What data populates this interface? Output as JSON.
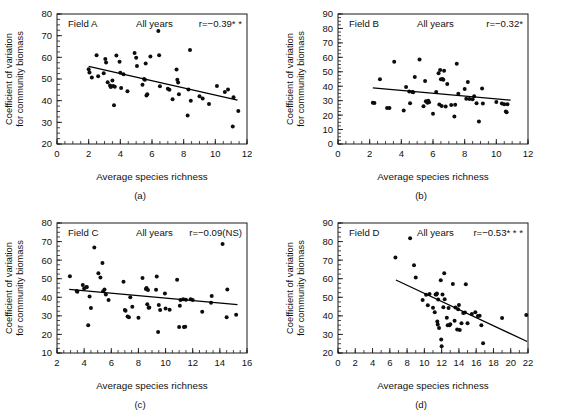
{
  "figure": {
    "title": "",
    "panel_count": 4
  },
  "common": {
    "xlabel": "Average species richness",
    "ylabel_line1": "Coefficient of variation",
    "ylabel_line2": "for community biomass",
    "years_note": "All years"
  },
  "chart_data": [
    {
      "type": "scatter",
      "panel": "(a)",
      "field_label": "Field A",
      "note": "All years",
      "r_label": "r=−0.39* *",
      "r_value": -0.39,
      "significance": "**",
      "title": "",
      "xlabel": "Average species richness",
      "ylabel": "Coefficient of variation for community biomass",
      "xlim": [
        0,
        12
      ],
      "ylim": [
        20,
        80
      ],
      "xticks": [
        0,
        2,
        4,
        6,
        8,
        10,
        12
      ],
      "yticks": [
        20,
        30,
        40,
        50,
        60,
        70,
        80
      ],
      "x_minor_step": 0.5,
      "y_minor_step": 2.5,
      "grid": false,
      "legend": "none",
      "fit_line": {
        "x0": 2.0,
        "y0": 55.8,
        "x1": 11.4,
        "y1": 40.2
      },
      "points": [
        [
          2.0,
          54.5
        ],
        [
          2.05,
          53.0
        ],
        [
          2.2,
          50.7
        ],
        [
          2.5,
          61.0
        ],
        [
          2.6,
          51.3
        ],
        [
          2.95,
          52.7
        ],
        [
          3.05,
          59.2
        ],
        [
          3.1,
          57.6
        ],
        [
          3.2,
          48.5
        ],
        [
          3.35,
          47.0
        ],
        [
          3.4,
          46.3
        ],
        [
          3.5,
          49.3
        ],
        [
          3.55,
          46.8
        ],
        [
          3.6,
          37.9
        ],
        [
          3.65,
          46.4
        ],
        [
          3.75,
          60.9
        ],
        [
          3.95,
          58.0
        ],
        [
          4.0,
          52.9
        ],
        [
          4.05,
          45.8
        ],
        [
          4.2,
          52.2
        ],
        [
          4.45,
          44.3
        ],
        [
          4.9,
          62.0
        ],
        [
          5.0,
          59.8
        ],
        [
          5.05,
          56.0
        ],
        [
          5.4,
          47.3
        ],
        [
          5.5,
          50.0
        ],
        [
          5.55,
          49.6
        ],
        [
          5.6,
          57.1
        ],
        [
          5.65,
          42.4
        ],
        [
          5.7,
          43.0
        ],
        [
          5.9,
          60.4
        ],
        [
          6.4,
          72.1
        ],
        [
          6.45,
          61.0
        ],
        [
          6.5,
          46.7
        ],
        [
          7.0,
          45.5
        ],
        [
          7.1,
          45.0
        ],
        [
          7.3,
          40.7
        ],
        [
          7.55,
          54.4
        ],
        [
          7.6,
          49.7
        ],
        [
          7.65,
          48.4
        ],
        [
          7.7,
          43.0
        ],
        [
          8.25,
          33.2
        ],
        [
          8.3,
          45.2
        ],
        [
          8.4,
          63.4
        ],
        [
          8.45,
          40.0
        ],
        [
          9.0,
          42.0
        ],
        [
          9.2,
          41.0
        ],
        [
          9.6,
          38.5
        ],
        [
          10.1,
          46.8
        ],
        [
          10.6,
          44.0
        ],
        [
          10.8,
          45.1
        ],
        [
          11.1,
          28.1
        ],
        [
          11.15,
          41.6
        ],
        [
          11.45,
          35.2
        ]
      ]
    },
    {
      "type": "scatter",
      "panel": "(b)",
      "field_label": "Field B",
      "note": "All years",
      "r_label": "r=−0.32*",
      "r_value": -0.32,
      "significance": "*",
      "title": "",
      "xlabel": "Average species richness",
      "ylabel": "Coefficient of variation for community biomass",
      "xlim": [
        0,
        12
      ],
      "ylim": [
        0,
        90
      ],
      "xticks": [
        0,
        2,
        4,
        6,
        8,
        10,
        12
      ],
      "yticks": [
        0,
        10,
        20,
        30,
        40,
        50,
        60,
        70,
        80,
        90
      ],
      "x_minor_step": 0.5,
      "y_minor_step": 2.5,
      "grid": false,
      "legend": "none",
      "fit_line": {
        "x0": 2.2,
        "y0": 38.8,
        "x1": 10.9,
        "y1": 30.4
      },
      "points": [
        [
          2.2,
          28.5
        ],
        [
          2.3,
          28.3
        ],
        [
          2.65,
          44.9
        ],
        [
          3.1,
          25.0
        ],
        [
          3.25,
          25.0
        ],
        [
          3.55,
          57.0
        ],
        [
          4.15,
          23.2
        ],
        [
          4.3,
          39.5
        ],
        [
          4.5,
          36.4
        ],
        [
          4.55,
          28.2
        ],
        [
          4.7,
          36.0
        ],
        [
          4.75,
          35.8
        ],
        [
          4.85,
          46.3
        ],
        [
          5.15,
          58.5
        ],
        [
          5.4,
          26.2
        ],
        [
          5.5,
          43.6
        ],
        [
          5.55,
          29.6
        ],
        [
          5.6,
          29.3
        ],
        [
          5.65,
          28.5
        ],
        [
          5.7,
          30.0
        ],
        [
          5.75,
          28.9
        ],
        [
          6.0,
          21.0
        ],
        [
          6.2,
          36.0
        ],
        [
          6.35,
          48.9
        ],
        [
          6.4,
          27.4
        ],
        [
          6.45,
          51.2
        ],
        [
          6.5,
          44.9
        ],
        [
          6.55,
          26.3
        ],
        [
          6.6,
          45.0
        ],
        [
          6.65,
          44.5
        ],
        [
          6.7,
          50.7
        ],
        [
          6.8,
          26.0
        ],
        [
          6.9,
          41.5
        ],
        [
          7.15,
          27.0
        ],
        [
          7.35,
          19.0
        ],
        [
          7.4,
          27.1
        ],
        [
          7.5,
          55.6
        ],
        [
          7.6,
          34.8
        ],
        [
          8.0,
          38.0
        ],
        [
          8.1,
          31.4
        ],
        [
          8.2,
          43.0
        ],
        [
          8.3,
          31.2
        ],
        [
          8.5,
          31.0
        ],
        [
          8.6,
          33.0
        ],
        [
          8.75,
          28.2
        ],
        [
          8.9,
          15.5
        ],
        [
          9.1,
          38.5
        ],
        [
          9.15,
          28.0
        ],
        [
          10.0,
          29.0
        ],
        [
          10.35,
          28.0
        ],
        [
          10.5,
          27.6
        ],
        [
          10.6,
          22.5
        ],
        [
          10.65,
          22.0
        ],
        [
          10.7,
          27.5
        ]
      ]
    },
    {
      "type": "scatter",
      "panel": "(c)",
      "field_label": "Field C",
      "note": "All years",
      "r_label": "r=−0.09(NS)",
      "r_value": -0.09,
      "significance": "NS",
      "title": "",
      "xlabel": "Average species richness",
      "ylabel": "Coefficient of variation for community biomass",
      "xlim": [
        2,
        16
      ],
      "ylim": [
        10,
        80
      ],
      "xticks": [
        2,
        4,
        6,
        8,
        10,
        12,
        14,
        16
      ],
      "yticks": [
        10,
        20,
        30,
        40,
        50,
        60,
        70,
        80
      ],
      "x_minor_step": 0.5,
      "y_minor_step": 2.5,
      "grid": false,
      "legend": "none",
      "fit_line": {
        "x0": 2.9,
        "y0": 44.3,
        "x1": 15.3,
        "y1": 36.0
      },
      "points": [
        [
          2.95,
          51.3
        ],
        [
          3.45,
          43.4
        ],
        [
          3.5,
          43.0
        ],
        [
          3.9,
          46.6
        ],
        [
          4.0,
          44.7
        ],
        [
          4.15,
          45.4
        ],
        [
          4.2,
          45.6
        ],
        [
          4.3,
          25.0
        ],
        [
          4.4,
          40.4
        ],
        [
          4.5,
          34.2
        ],
        [
          4.75,
          66.8
        ],
        [
          5.05,
          53.0
        ],
        [
          5.2,
          50.6
        ],
        [
          5.35,
          58.4
        ],
        [
          5.4,
          43.2
        ],
        [
          5.5,
          44.2
        ],
        [
          5.6,
          41.5
        ],
        [
          5.8,
          38.5
        ],
        [
          6.9,
          48.3
        ],
        [
          7.0,
          33.2
        ],
        [
          7.05,
          32.8
        ],
        [
          7.2,
          29.6
        ],
        [
          7.3,
          29.2
        ],
        [
          7.4,
          40.0
        ],
        [
          7.55,
          34.9
        ],
        [
          8.0,
          29.0
        ],
        [
          8.3,
          50.4
        ],
        [
          8.55,
          44.5
        ],
        [
          8.6,
          45.0
        ],
        [
          8.65,
          36.3
        ],
        [
          8.7,
          43.9
        ],
        [
          8.75,
          34.3
        ],
        [
          8.8,
          34.5
        ],
        [
          9.3,
          44.0
        ],
        [
          9.35,
          51.2
        ],
        [
          9.45,
          21.3
        ],
        [
          9.5,
          35.8
        ],
        [
          9.6,
          33.2
        ],
        [
          9.95,
          42.1
        ],
        [
          10.0,
          34.0
        ],
        [
          10.3,
          33.3
        ],
        [
          10.85,
          49.4
        ],
        [
          11.0,
          24.0
        ],
        [
          11.05,
          35.5
        ],
        [
          11.1,
          38.5
        ],
        [
          11.3,
          39.0
        ],
        [
          11.35,
          24.0
        ],
        [
          11.45,
          24.1
        ],
        [
          11.5,
          38.7
        ],
        [
          11.85,
          39.0
        ],
        [
          12.0,
          38.6
        ],
        [
          12.7,
          32.2
        ],
        [
          13.35,
          37.0
        ],
        [
          13.4,
          40.7
        ],
        [
          14.2,
          68.7
        ],
        [
          14.5,
          29.2
        ],
        [
          14.55,
          44.2
        ],
        [
          15.2,
          30.6
        ]
      ]
    },
    {
      "type": "scatter",
      "panel": "(d)",
      "field_label": "Field D",
      "note": "All years",
      "r_label": "r=−0.53* * *",
      "r_value": -0.53,
      "significance": "***",
      "title": "",
      "xlabel": "Average species richness",
      "ylabel": "Coefficient of variation for community biomass",
      "xlim": [
        0,
        22
      ],
      "ylim": [
        20,
        90
      ],
      "xticks": [
        0,
        2,
        4,
        6,
        8,
        10,
        12,
        14,
        16,
        18,
        20,
        22
      ],
      "yticks": [
        20,
        30,
        40,
        50,
        60,
        70,
        80,
        90
      ],
      "x_minor_step": 1,
      "y_minor_step": 2.5,
      "grid": false,
      "legend": "none",
      "fit_line": {
        "x0": 6.7,
        "y0": 59.3,
        "x1": 21.9,
        "y1": 26.2
      },
      "points": [
        [
          6.65,
          71.4
        ],
        [
          8.35,
          81.8
        ],
        [
          8.8,
          67.2
        ],
        [
          9.0,
          60.6
        ],
        [
          9.8,
          48.5
        ],
        [
          10.2,
          51.4
        ],
        [
          10.4,
          45.7
        ],
        [
          10.6,
          51.8
        ],
        [
          11.0,
          44.3
        ],
        [
          11.2,
          42.0
        ],
        [
          11.3,
          51.5
        ],
        [
          11.4,
          51.5
        ],
        [
          11.45,
          52.0
        ],
        [
          11.5,
          37.0
        ],
        [
          11.55,
          35.4
        ],
        [
          11.6,
          48.8
        ],
        [
          11.7,
          33.4
        ],
        [
          11.9,
          59.2
        ],
        [
          11.95,
          27.3
        ],
        [
          12.0,
          23.7
        ],
        [
          12.1,
          51.5
        ],
        [
          12.2,
          44.6
        ],
        [
          12.3,
          63.0
        ],
        [
          12.35,
          49.0
        ],
        [
          12.6,
          39.0
        ],
        [
          12.7,
          35.0
        ],
        [
          12.8,
          44.2
        ],
        [
          12.9,
          34.9
        ],
        [
          13.0,
          35.5
        ],
        [
          13.3,
          57.2
        ],
        [
          13.5,
          37.3
        ],
        [
          13.6,
          44.5
        ],
        [
          13.8,
          32.6
        ],
        [
          13.9,
          43.5
        ],
        [
          14.0,
          45.8
        ],
        [
          14.1,
          32.4
        ],
        [
          14.3,
          36.0
        ],
        [
          14.5,
          41.6
        ],
        [
          14.7,
          41.8
        ],
        [
          14.8,
          57.0
        ],
        [
          15.0,
          36.0
        ],
        [
          15.5,
          41.0
        ],
        [
          15.9,
          42.0
        ],
        [
          16.2,
          39.9
        ],
        [
          16.4,
          40.0
        ],
        [
          16.6,
          35.0
        ],
        [
          16.8,
          25.3
        ],
        [
          19.0,
          38.9
        ],
        [
          21.8,
          40.5
        ]
      ]
    }
  ]
}
